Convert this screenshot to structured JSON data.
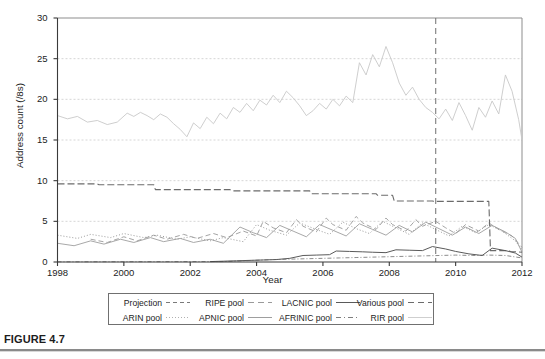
{
  "figure": {
    "caption": "FIGURE 4.7"
  },
  "chart_data": {
    "type": "line",
    "title": "",
    "xlabel": "Year",
    "ylabel": "Address count (/8s)",
    "xlim": [
      1998,
      2012
    ],
    "ylim": [
      0,
      30
    ],
    "xticks": [
      1998,
      2000,
      2002,
      2004,
      2006,
      2008,
      2010,
      2012
    ],
    "xtick_labels": [
      "1998",
      "2000",
      "2002",
      "2004",
      "2006",
      "2008",
      "2010",
      "2012"
    ],
    "yticks": [
      0,
      5,
      10,
      15,
      20,
      25,
      30
    ],
    "ytick_labels": [
      "0",
      "5",
      "10",
      "15",
      "20",
      "25",
      "30"
    ],
    "grid": "horizontal-dashed",
    "legend_position": "below-axes",
    "annotations": [
      {
        "name": "projection-start-line",
        "type": "vline",
        "x": 2009.4,
        "style": "dashed",
        "color": "#6f6f6f"
      }
    ],
    "series": [
      {
        "name": "Projection",
        "color": "#7a7a7a",
        "dash": "4,3",
        "width": 1.0,
        "note": "vertical dashed marker at 2009.4 separating history from projection"
      },
      {
        "name": "RIPE pool",
        "color": "#9a9a9a",
        "dash": "5,3",
        "width": 0.9,
        "x": [
          1999.0,
          1999.5,
          2000.0,
          2000.4,
          2000.9,
          2001.3,
          2001.8,
          2002.2,
          2002.7,
          2003.1,
          2003.6,
          2004.0,
          2004.2,
          2004.5,
          2004.9,
          2005.2,
          2005.4,
          2005.8,
          2006.1,
          2006.3,
          2006.7,
          2007.0,
          2007.2,
          2007.6,
          2007.9,
          2008.1,
          2008.5,
          2008.8,
          2009.0,
          2009.4,
          2009.7,
          2010.0,
          2010.3,
          2010.7,
          2011.0,
          2011.3,
          2011.7,
          2012.0
        ],
        "y": [
          2.8,
          2.4,
          3.1,
          2.6,
          3.3,
          2.8,
          3.4,
          2.9,
          3.5,
          3.0,
          3.8,
          3.2,
          5.0,
          4.2,
          3.6,
          5.2,
          4.4,
          3.7,
          5.4,
          4.6,
          3.9,
          5.6,
          4.8,
          4.0,
          5.4,
          4.6,
          3.8,
          5.2,
          4.4,
          5.0,
          4.2,
          3.5,
          4.6,
          3.8,
          4.8,
          4.0,
          3.2,
          1.8
        ]
      },
      {
        "name": "LACNIC pool",
        "color": "#5a5a5a",
        "dash": "none",
        "width": 1.0,
        "x": [
          2002.6,
          2003.0,
          2003.4,
          2003.8,
          2004.2,
          2004.6,
          2005.0,
          2005.4,
          2005.8,
          2006.2,
          2006.4,
          2006.8,
          2007.2,
          2007.5,
          2007.9,
          2008.2,
          2008.6,
          2009.0,
          2009.3,
          2009.7,
          2010.0,
          2010.4,
          2010.8,
          2011.1,
          2011.5,
          2011.8,
          2012.0
        ],
        "y": [
          0.05,
          0.1,
          0.15,
          0.2,
          0.25,
          0.3,
          0.45,
          0.8,
          0.85,
          0.9,
          1.35,
          1.3,
          1.25,
          1.2,
          1.15,
          1.5,
          1.45,
          1.4,
          1.9,
          1.6,
          1.3,
          1.0,
          0.8,
          1.7,
          1.4,
          1.1,
          0.6
        ]
      },
      {
        "name": "Various pool",
        "color": "#6b6b6b",
        "dash": "7,3",
        "width": 1.1,
        "x": [
          1998.0,
          1999.2,
          1999.25,
          2000.9,
          2000.95,
          2003.2,
          2003.25,
          2005.6,
          2005.65,
          2007.6,
          2007.65,
          2008.1,
          2008.15,
          2009.3,
          2009.35,
          2011.0,
          2011.05,
          2011.6,
          2011.65,
          2012.0
        ],
        "y": [
          9.6,
          9.6,
          9.5,
          9.5,
          8.9,
          8.9,
          8.75,
          8.75,
          8.4,
          8.4,
          8.2,
          8.2,
          7.5,
          7.5,
          7.45,
          7.45,
          1.4,
          1.4,
          1.3,
          1.2
        ]
      },
      {
        "name": "ARIN pool",
        "color": "#8f8f8f",
        "dash": "1,2",
        "width": 0.9,
        "x": [
          1998.0,
          1998.6,
          1999.0,
          1999.6,
          2000.0,
          2000.6,
          2001.0,
          2001.6,
          2002.0,
          2002.6,
          2003.0,
          2003.6,
          2004.0,
          2004.4,
          2004.9,
          2005.3,
          2005.8,
          2006.2,
          2006.6,
          2007.0,
          2007.4,
          2007.8,
          2008.2,
          2008.6,
          2009.0,
          2009.4,
          2009.8,
          2010.2,
          2010.6,
          2011.0,
          2011.4,
          2011.8,
          2012.0
        ],
        "y": [
          3.3,
          2.9,
          3.4,
          3.0,
          3.5,
          3.0,
          3.3,
          2.8,
          3.1,
          2.6,
          3.0,
          2.5,
          4.6,
          3.9,
          3.3,
          4.8,
          4.0,
          3.4,
          4.9,
          4.1,
          3.5,
          5.0,
          4.2,
          3.4,
          4.8,
          4.0,
          3.2,
          4.4,
          3.6,
          4.6,
          3.8,
          2.6,
          1.5
        ]
      },
      {
        "name": "APNIC pool",
        "color": "#9e9e9e",
        "dash": "none",
        "width": 0.9,
        "x": [
          1998.0,
          1998.5,
          1999.0,
          1999.4,
          1999.9,
          2000.3,
          2000.8,
          2001.2,
          2001.7,
          2002.1,
          2002.6,
          2003.0,
          2003.5,
          2003.9,
          2004.3,
          2004.7,
          2005.1,
          2005.5,
          2005.9,
          2006.3,
          2006.7,
          2007.1,
          2007.5,
          2007.9,
          2008.3,
          2008.7,
          2009.1,
          2009.5,
          2009.9,
          2010.3,
          2010.7,
          2011.1,
          2011.5,
          2011.8,
          2012.0
        ],
        "y": [
          2.3,
          2.0,
          2.6,
          2.2,
          2.8,
          2.4,
          3.0,
          2.5,
          2.9,
          2.4,
          2.8,
          2.3,
          4.3,
          3.6,
          3.0,
          4.5,
          3.8,
          3.1,
          4.6,
          3.9,
          3.2,
          4.7,
          4.0,
          3.3,
          4.5,
          3.7,
          4.9,
          4.1,
          3.3,
          4.3,
          3.5,
          4.5,
          3.7,
          2.9,
          1.2
        ]
      },
      {
        "name": "AFRINIC pool",
        "color": "#7e7e7e",
        "dash": "4,2,1,2",
        "width": 0.9,
        "x": [
          1998.0,
          2003.0,
          2004.5,
          2005.0,
          2005.5,
          2006.0,
          2006.5,
          2007.0,
          2007.5,
          2008.0,
          2008.5,
          2009.0,
          2009.5,
          2010.0,
          2010.5,
          2011.0,
          2011.5,
          2012.0
        ],
        "y": [
          0.02,
          0.05,
          0.3,
          0.35,
          0.4,
          0.45,
          0.5,
          0.55,
          0.6,
          0.65,
          0.7,
          0.75,
          0.8,
          0.85,
          0.8,
          0.85,
          0.8,
          0.5
        ]
      },
      {
        "name": "RIR pool",
        "color": "#c8c8c8",
        "dash": "none",
        "width": 0.9,
        "x": [
          1998.0,
          1998.3,
          1998.6,
          1998.9,
          1999.2,
          1999.5,
          1999.8,
          2000.1,
          2000.3,
          2000.5,
          2000.7,
          2000.9,
          2001.1,
          2001.3,
          2001.5,
          2001.7,
          2001.9,
          2002.1,
          2002.3,
          2002.5,
          2002.7,
          2002.9,
          2003.1,
          2003.3,
          2003.5,
          2003.7,
          2003.9,
          2004.1,
          2004.3,
          2004.5,
          2004.7,
          2004.9,
          2005.1,
          2005.3,
          2005.5,
          2005.7,
          2005.9,
          2006.1,
          2006.3,
          2006.5,
          2006.7,
          2006.9,
          2007.1,
          2007.3,
          2007.5,
          2007.7,
          2007.9,
          2008.1,
          2008.3,
          2008.5,
          2008.7,
          2008.9,
          2009.1,
          2009.3,
          2009.5,
          2009.7,
          2009.9,
          2010.1,
          2010.3,
          2010.5,
          2010.7,
          2010.9,
          2011.1,
          2011.3,
          2011.5,
          2011.7,
          2011.9,
          2012.0
        ],
        "y": [
          18.0,
          17.6,
          17.9,
          17.2,
          17.4,
          16.9,
          17.2,
          18.3,
          17.9,
          18.4,
          18.0,
          17.5,
          18.2,
          17.8,
          17.0,
          16.3,
          15.4,
          17.1,
          16.4,
          17.8,
          17.0,
          18.3,
          17.6,
          19.0,
          18.4,
          19.5,
          18.6,
          19.9,
          19.3,
          20.5,
          19.6,
          21.0,
          20.2,
          19.2,
          18.0,
          18.6,
          19.5,
          18.8,
          20.0,
          19.2,
          20.4,
          19.6,
          24.5,
          23.0,
          25.5,
          24.0,
          26.5,
          24.5,
          22.0,
          20.5,
          21.5,
          20.0,
          19.0,
          18.4,
          17.6,
          18.8,
          17.4,
          19.6,
          18.0,
          16.2,
          19.0,
          17.8,
          19.8,
          18.2,
          23.0,
          21.0,
          17.5,
          15.0
        ]
      }
    ]
  },
  "axes": {
    "y_title": "Address count (/8s)",
    "x_title": "Year"
  },
  "legend": {
    "rows": [
      [
        {
          "label": "Projection",
          "style": "dashed-medium",
          "color": "#7a7a7a"
        },
        {
          "label": "RIPE pool",
          "style": "dashed-long",
          "color": "#9a9a9a"
        },
        {
          "label": "LACNIC pool",
          "style": "solid",
          "color": "#5a5a5a"
        },
        {
          "label": "Various pool",
          "style": "dashed-long",
          "color": "#6b6b6b"
        }
      ],
      [
        {
          "label": "ARIN pool",
          "style": "dotted",
          "color": "#b0b0b0"
        },
        {
          "label": "APNIC pool",
          "style": "solid",
          "color": "#9e9e9e"
        },
        {
          "label": "AFRINIC pool",
          "style": "dash-dot",
          "color": "#7e7e7e"
        },
        {
          "label": "RIR pool",
          "style": "solid-light",
          "color": "#cfcfcf"
        }
      ]
    ]
  },
  "colors": {
    "axis": "#3a3a3a",
    "grid": "#cccccc",
    "background": "#ffffff",
    "caption_rule": "#8a8a8a"
  }
}
